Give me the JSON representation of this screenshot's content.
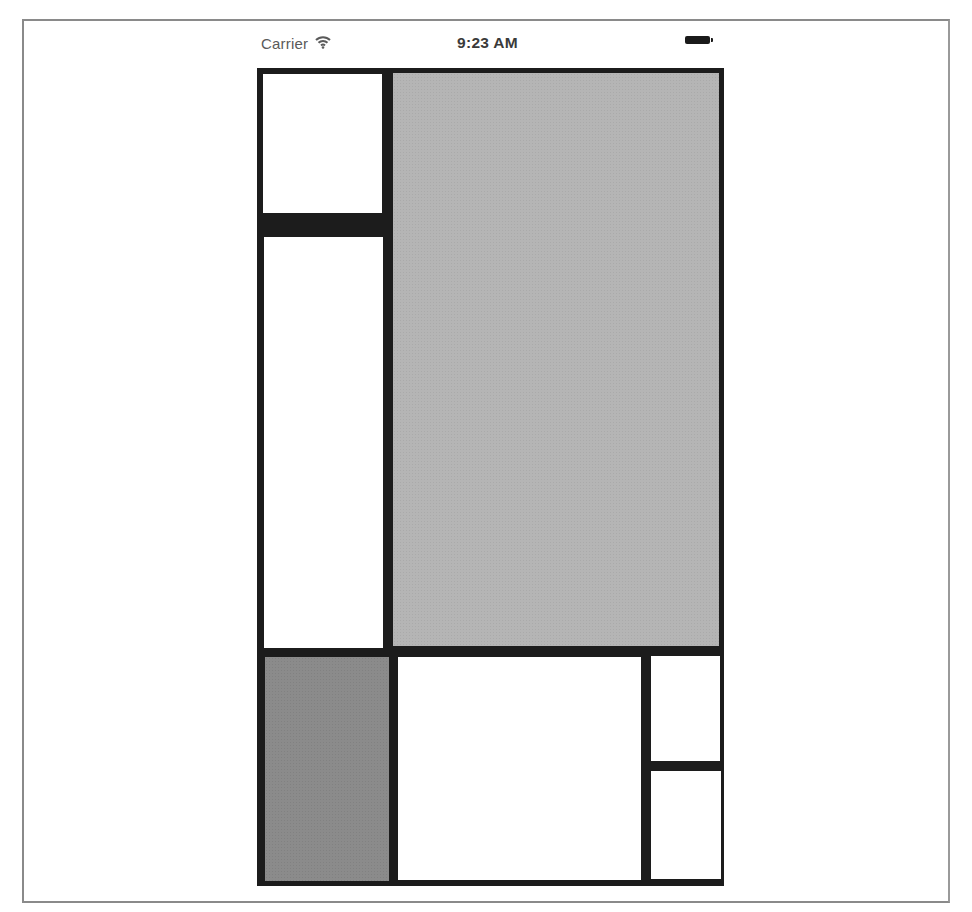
{
  "status_bar": {
    "carrier": "Carrier",
    "wifi_icon": "wifi-icon",
    "time": "9:23 AM",
    "battery_icon": "battery-full-icon"
  },
  "colors": {
    "divider": "#1c1c1c",
    "white": "#ffffff",
    "light_grey": "#b5b5b5",
    "dark_grey": "#8b8b8b",
    "page_border": "#8a8a8a"
  },
  "layout": {
    "views": [
      {
        "name": "top-left-view",
        "color": "white"
      },
      {
        "name": "left-tall-view",
        "color": "white"
      },
      {
        "name": "main-view",
        "color": "light_grey"
      },
      {
        "name": "bottom-left-view",
        "color": "dark_grey"
      },
      {
        "name": "bottom-middle-view",
        "color": "white"
      },
      {
        "name": "bottom-right-top-view",
        "color": "white"
      },
      {
        "name": "bottom-right-bottom-view",
        "color": "white"
      }
    ]
  }
}
